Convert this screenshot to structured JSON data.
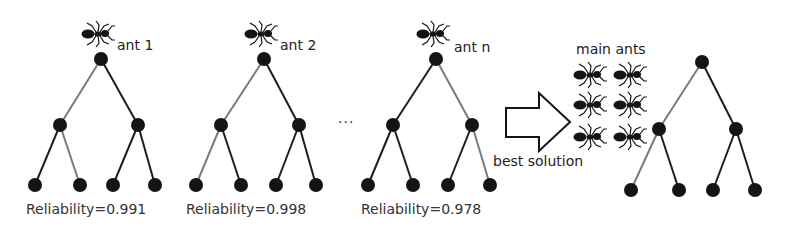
{
  "diagram": {
    "colors": {
      "node": "#141414",
      "edge_dark": "#1e1e1e",
      "edge_gray": "#7a7a7a",
      "text": "#222222"
    },
    "trees": [
      {
        "ant_label": "ant 1",
        "reliability": "Reliability=0.991"
      },
      {
        "ant_label": "ant 2",
        "reliability": "Reliability=0.998"
      },
      {
        "ant_label": "ant n",
        "reliability": "Reliability=0.978"
      }
    ],
    "ellipsis": "...",
    "arrow_label": "best solution",
    "main_ants_label": "main ants",
    "main_ants_count": 6
  }
}
